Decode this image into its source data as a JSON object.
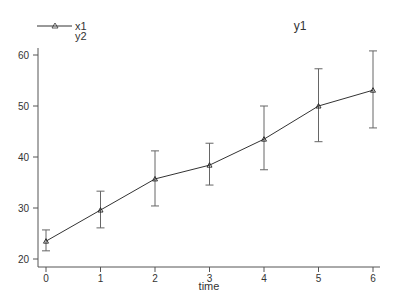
{
  "chart_data": {
    "type": "line",
    "title": "y1",
    "xlabel": "time",
    "ylabel": "",
    "x": [
      0,
      1,
      2,
      3,
      4,
      5,
      6
    ],
    "series": [
      {
        "name": "x1",
        "marker": "triangle",
        "values": [
          23.5,
          29.6,
          35.7,
          38.4,
          43.5,
          50.0,
          53.1
        ],
        "error_upper": [
          25.7,
          33.3,
          41.2,
          42.7,
          50.0,
          57.3,
          60.8
        ],
        "error_lower": [
          21.6,
          26.1,
          30.4,
          34.5,
          37.5,
          43.0,
          45.7
        ]
      }
    ],
    "xticks": [
      "0",
      "1",
      "2",
      "3",
      "4",
      "5",
      "6"
    ],
    "yticks": [
      "20",
      "30",
      "40",
      "50",
      "60"
    ],
    "ylim": [
      18.5,
      62
    ],
    "xlim": [
      -0.2,
      6.1
    ],
    "grid": false,
    "legend": {
      "position": "top-left",
      "entries": [
        "x1",
        "y2"
      ]
    }
  }
}
